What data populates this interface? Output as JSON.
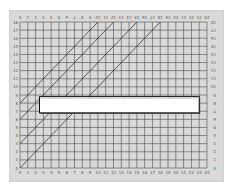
{
  "diagram": {
    "type": "grid-chart-with-diagonals",
    "x_axis": {
      "min": 0,
      "max": 24,
      "labels": [
        "0",
        "1",
        "2",
        "3",
        "4",
        "5",
        "6",
        "7",
        "8",
        "9",
        "10",
        "11",
        "12",
        "13",
        "14",
        "15",
        "16",
        "17",
        "18",
        "19",
        "20",
        "21",
        "22",
        "23",
        "24"
      ]
    },
    "y_axis": {
      "min": 0,
      "max": 18,
      "labels": [
        "0",
        "1",
        "2",
        "3",
        "4",
        "5",
        "6",
        "7",
        "8",
        "9",
        "10",
        "11",
        "12",
        "13",
        "14",
        "15",
        "16",
        "17",
        "18"
      ]
    },
    "diagonal_lines": [
      {
        "x1": 0,
        "y1": 8,
        "x2": 10,
        "y2": 18
      },
      {
        "x1": 0,
        "y1": 6,
        "x2": 12,
        "y2": 18
      },
      {
        "x1": 0,
        "y1": 3,
        "x2": 15,
        "y2": 18
      },
      {
        "x1": 0,
        "y1": 0,
        "x2": 18,
        "y2": 18
      }
    ],
    "overlay_box": {
      "x_start": 2.5,
      "x_end": 23.0,
      "y_top": 8.8,
      "y_bottom": 6.8,
      "top_edge": "dashed"
    },
    "colors": {
      "background": "#d9d9d9",
      "grid": "#4a4a4a",
      "lines": "#333333",
      "box_fill": "#ffffff",
      "box_border": "#111111"
    }
  }
}
